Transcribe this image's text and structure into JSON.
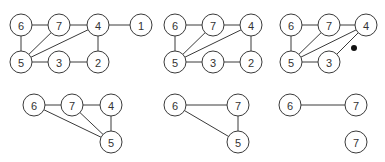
{
  "diagram": {
    "node_radius": 11,
    "colors": {
      "stroke": "#3a3a3a",
      "label": "#333333",
      "fill": "#ffffff",
      "dot": "#111111"
    },
    "graphs": [
      {
        "id": "g1",
        "nodes": [
          {
            "id": "6",
            "label": "6",
            "x": 21,
            "y": 25
          },
          {
            "id": "7",
            "label": "7",
            "x": 59,
            "y": 25
          },
          {
            "id": "4",
            "label": "4",
            "x": 98,
            "y": 25
          },
          {
            "id": "1",
            "label": "1",
            "x": 141,
            "y": 25
          },
          {
            "id": "5",
            "label": "5",
            "x": 21,
            "y": 62
          },
          {
            "id": "3",
            "label": "3",
            "x": 59,
            "y": 62
          },
          {
            "id": "2",
            "label": "2",
            "x": 98,
            "y": 62
          }
        ],
        "edges": [
          [
            "6",
            "7"
          ],
          [
            "7",
            "4"
          ],
          [
            "4",
            "1"
          ],
          [
            "6",
            "5"
          ],
          [
            "5",
            "7"
          ],
          [
            "5",
            "4"
          ],
          [
            "5",
            "3"
          ],
          [
            "3",
            "2"
          ],
          [
            "4",
            "2"
          ]
        ],
        "dots": []
      },
      {
        "id": "g2",
        "nodes": [
          {
            "id": "6",
            "label": "6",
            "x": 175,
            "y": 25
          },
          {
            "id": "7",
            "label": "7",
            "x": 213,
            "y": 25
          },
          {
            "id": "4",
            "label": "4",
            "x": 251,
            "y": 25
          },
          {
            "id": "5",
            "label": "5",
            "x": 175,
            "y": 62
          },
          {
            "id": "3",
            "label": "3",
            "x": 213,
            "y": 62
          },
          {
            "id": "2",
            "label": "2",
            "x": 251,
            "y": 62
          }
        ],
        "edges": [
          [
            "6",
            "7"
          ],
          [
            "7",
            "4"
          ],
          [
            "6",
            "5"
          ],
          [
            "5",
            "7"
          ],
          [
            "5",
            "4"
          ],
          [
            "5",
            "3"
          ],
          [
            "3",
            "2"
          ],
          [
            "4",
            "2"
          ]
        ],
        "dots": []
      },
      {
        "id": "g3",
        "nodes": [
          {
            "id": "6",
            "label": "6",
            "x": 291,
            "y": 25
          },
          {
            "id": "7",
            "label": "7",
            "x": 329,
            "y": 25
          },
          {
            "id": "4",
            "label": "4",
            "x": 366,
            "y": 25
          },
          {
            "id": "5",
            "label": "5",
            "x": 291,
            "y": 62
          },
          {
            "id": "3",
            "label": "3",
            "x": 329,
            "y": 62
          }
        ],
        "edges": [
          [
            "6",
            "7"
          ],
          [
            "7",
            "4"
          ],
          [
            "6",
            "5"
          ],
          [
            "5",
            "7"
          ],
          [
            "5",
            "4"
          ],
          [
            "5",
            "3"
          ],
          [
            "3",
            "4"
          ]
        ],
        "dots": [
          {
            "x": 354,
            "y": 48,
            "r": 3
          }
        ]
      },
      {
        "id": "g4",
        "nodes": [
          {
            "id": "6",
            "label": "6",
            "x": 34,
            "y": 105
          },
          {
            "id": "7",
            "label": "7",
            "x": 72,
            "y": 105
          },
          {
            "id": "4",
            "label": "4",
            "x": 111,
            "y": 105
          },
          {
            "id": "5",
            "label": "5",
            "x": 111,
            "y": 142
          }
        ],
        "edges": [
          [
            "6",
            "7"
          ],
          [
            "7",
            "4"
          ],
          [
            "4",
            "5"
          ],
          [
            "7",
            "5"
          ],
          [
            "6",
            "5"
          ]
        ],
        "dots": []
      },
      {
        "id": "g5",
        "nodes": [
          {
            "id": "6",
            "label": "6",
            "x": 175,
            "y": 105
          },
          {
            "id": "7",
            "label": "7",
            "x": 238,
            "y": 105
          },
          {
            "id": "5",
            "label": "5",
            "x": 238,
            "y": 142
          }
        ],
        "edges": [
          [
            "6",
            "7"
          ],
          [
            "7",
            "5"
          ],
          [
            "6",
            "5"
          ]
        ],
        "dots": []
      },
      {
        "id": "g6",
        "nodes": [
          {
            "id": "6",
            "label": "6",
            "x": 290,
            "y": 105
          },
          {
            "id": "7",
            "label": "7",
            "x": 356,
            "y": 105
          }
        ],
        "edges": [
          [
            "6",
            "7"
          ]
        ],
        "dots": []
      },
      {
        "id": "g7",
        "nodes": [
          {
            "id": "7",
            "label": "7",
            "x": 356,
            "y": 142
          }
        ],
        "edges": [],
        "dots": []
      }
    ]
  }
}
